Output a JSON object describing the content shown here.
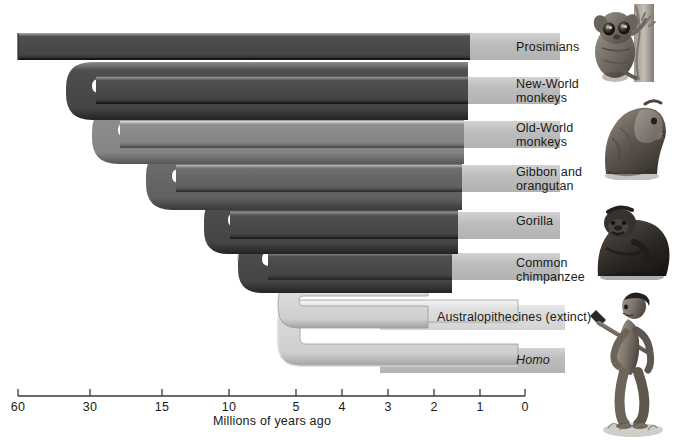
{
  "figure": {
    "type": "phylogenetic-tree",
    "orientation": "left-to-right",
    "axis_caption": "Millions of years ago",
    "axis": {
      "label": "Millions of years ago",
      "ticks": [
        {
          "value": 60,
          "label": "60",
          "x": 18
        },
        {
          "value": 30,
          "label": "30",
          "x": 90
        },
        {
          "value": 15,
          "label": "15",
          "x": 162
        },
        {
          "value": 10,
          "label": "10",
          "x": 229
        },
        {
          "value": 5,
          "label": "5",
          "x": 296
        },
        {
          "value": 4,
          "label": "4",
          "x": 342
        },
        {
          "value": 3,
          "label": "3",
          "x": 388
        },
        {
          "value": 2,
          "label": "2",
          "x": 434
        },
        {
          "value": 1,
          "label": "1",
          "x": 480
        },
        {
          "value": 0,
          "label": "0",
          "x": 525
        }
      ],
      "line_color": "#3a3a3a"
    },
    "taxa": [
      {
        "id": "prosimians",
        "label": "Prosimians",
        "divergence_mya": 60,
        "branch_shade": "dark",
        "label_x": 516,
        "label_y": 41,
        "italic": false
      },
      {
        "id": "new-world-monkeys",
        "label": "New-World\nmonkeys",
        "divergence_mya": 38,
        "branch_shade": "dark",
        "label_x": 516,
        "label_y": 85,
        "italic": false
      },
      {
        "id": "old-world-monkeys",
        "label": "Old-World\nmonkeys",
        "divergence_mya": 32,
        "branch_shade": "medium",
        "label_x": 516,
        "label_y": 128,
        "italic": false
      },
      {
        "id": "gibbon-and-orangutan",
        "label": "Gibbon and\norangutan",
        "divergence_mya": 22,
        "branch_shade": "medium-dark",
        "label_x": 516,
        "label_y": 172,
        "italic": false
      },
      {
        "id": "gorilla",
        "label": "Gorilla",
        "divergence_mya": 9,
        "branch_shade": "dark",
        "label_x": 516,
        "label_y": 222,
        "italic": false
      },
      {
        "id": "common-chimpanzee",
        "label": "Common\nchimpanzee",
        "divergence_mya": 6,
        "branch_shade": "dark",
        "label_x": 516,
        "label_y": 260,
        "italic": false
      },
      {
        "id": "australopithecines",
        "label": "Australopithecines (extinct)",
        "divergence_mya": 5,
        "branch_shade": "light",
        "label_x": 437,
        "label_y": 314,
        "italic": false
      },
      {
        "id": "homo",
        "label": "Homo",
        "divergence_mya": 2.6,
        "branch_shade": "light",
        "label_x": 516,
        "label_y": 357,
        "italic": true
      }
    ],
    "illustrations": [
      {
        "id": "prosimian-photo",
        "name": "tarsier-illustration",
        "alt": "Prosimian (tarsier) clinging to a branch"
      },
      {
        "id": "old-world-monkey-photo",
        "name": "macaque-illustration",
        "alt": "Old-World monkey sitting"
      },
      {
        "id": "gorilla-photo",
        "name": "gorilla-illustration",
        "alt": "Gorilla seated"
      },
      {
        "id": "hominid-photo",
        "name": "early-human-illustration",
        "alt": "Early hominid walking with a spear"
      }
    ],
    "colors": {
      "branch_dark": "#4a4a4a",
      "branch_medium": "#7a7a7a",
      "branch_light": "#d2d2d2",
      "label_bar": "#bcbcbc",
      "highlight": "#f2f2f2",
      "shadow": "#2b2b2b",
      "text": "#1a1a1a",
      "background": "#ffffff"
    }
  }
}
